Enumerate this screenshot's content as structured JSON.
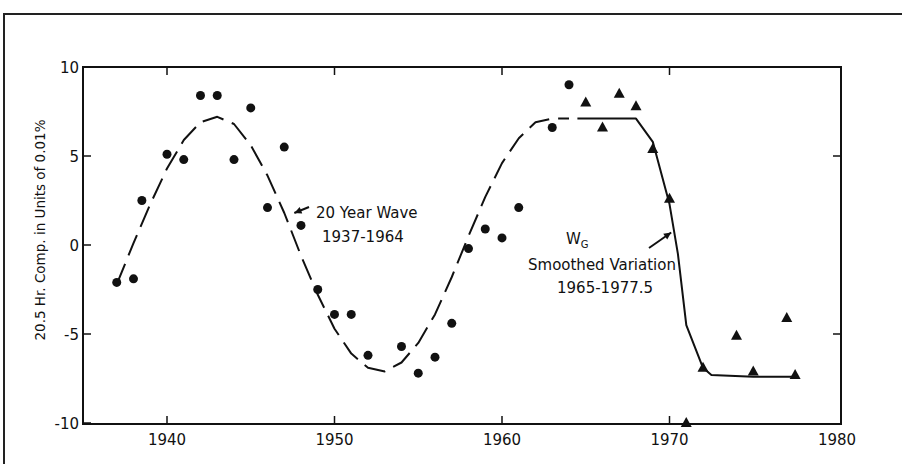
{
  "chart_data": {
    "type": "scatter",
    "title": "",
    "xlabel": "",
    "ylabel": "20.5 Hr. Comp. in Units of 0.01%",
    "xlim": [
      1935,
      1980
    ],
    "ylim": [
      -10,
      10
    ],
    "x_ticks": [
      1940,
      1950,
      1960,
      1970,
      1980
    ],
    "y_ticks": [
      10,
      5,
      0,
      -5,
      -10
    ],
    "x_tick_labels": [
      "1940",
      "1950",
      "1960",
      "1970",
      "1980"
    ],
    "y_tick_labels": [
      "10",
      "5",
      "0",
      "-5",
      "-10"
    ],
    "grid": false,
    "series": [
      {
        "name": "Observed (circles)",
        "marker": "circle",
        "x": [
          1937,
          1938,
          1938.5,
          1940,
          1941,
          1942,
          1943,
          1944,
          1945,
          1946,
          1947,
          1948,
          1949,
          1950,
          1951,
          1952,
          1954,
          1955,
          1956,
          1957,
          1958,
          1959,
          1960,
          1961,
          1963,
          1964
        ],
        "y": [
          -2.1,
          -1.9,
          2.5,
          5.1,
          4.8,
          8.4,
          8.4,
          4.8,
          7.7,
          2.1,
          5.5,
          1.1,
          -2.5,
          -3.9,
          -3.9,
          -6.2,
          -5.7,
          -7.2,
          -6.3,
          -4.4,
          -0.2,
          0.9,
          0.4,
          2.1,
          6.6,
          9.0
        ]
      },
      {
        "name": "Observed (triangles)",
        "marker": "triangle",
        "x": [
          1965,
          1966,
          1967,
          1968,
          1969,
          1970,
          1971,
          1972,
          1974,
          1975,
          1977,
          1977.5
        ],
        "y": [
          8.0,
          6.6,
          8.5,
          7.8,
          5.4,
          2.6,
          -10.0,
          -6.9,
          -5.1,
          -7.1,
          -4.1,
          -7.3
        ]
      },
      {
        "name": "20 Year Wave 1937-1964",
        "style": "dashed",
        "x": [
          1937,
          1938,
          1939,
          1940,
          1941,
          1942,
          1943,
          1944,
          1945,
          1946,
          1947,
          1948,
          1949,
          1950,
          1951,
          1952,
          1953,
          1954,
          1955,
          1956,
          1957,
          1958,
          1959,
          1960,
          1961,
          1962,
          1963,
          1964
        ],
        "y": [
          -2.2,
          0.1,
          2.3,
          4.3,
          5.9,
          6.9,
          7.2,
          6.8,
          5.6,
          3.9,
          1.8,
          -0.6,
          -2.8,
          -4.7,
          -6.1,
          -6.9,
          -7.1,
          -6.6,
          -5.5,
          -3.9,
          -1.8,
          0.5,
          2.7,
          4.6,
          6.0,
          6.9,
          7.1,
          7.1
        ]
      },
      {
        "name": "W_G Smoothed Variation 1965-1977.5",
        "style": "solid",
        "x": [
          1964.5,
          1968,
          1969,
          1970,
          1970.5,
          1971,
          1972,
          1972.5,
          1975,
          1977.5
        ],
        "y": [
          7.1,
          7.1,
          5.8,
          2.3,
          -0.5,
          -4.5,
          -6.9,
          -7.3,
          -7.4,
          -7.4
        ]
      }
    ],
    "annotations": [
      {
        "text_line1": "20 Year Wave",
        "text_line2": "1937-1964",
        "arrow_to": [
          1947.6,
          1.8
        ]
      },
      {
        "text_line0": "W",
        "subscript": "G",
        "text_line1": "Smoothed Variation",
        "text_line2": "1965-1977.5",
        "arrow_to": [
          1970.1,
          0.7
        ]
      }
    ]
  }
}
